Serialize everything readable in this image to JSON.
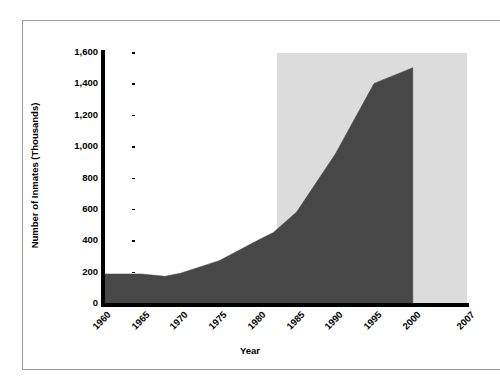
{
  "chart_data": {
    "type": "area",
    "title": "",
    "xlabel": "Year",
    "ylabel": "Number of Inmates (Thousands)",
    "xlim": [
      1960,
      2007
    ],
    "ylim": [
      0,
      1600
    ],
    "grid": false,
    "legend": null,
    "x_tick_labels": [
      "1960",
      "1965",
      "1970",
      "1975",
      "1980",
      "1985",
      "1990",
      "1995",
      "2000",
      "2007"
    ],
    "x_tick_values": [
      1960,
      1965,
      1970,
      1975,
      1980,
      1985,
      1990,
      1995,
      2000,
      2007
    ],
    "y_tick_labels": [
      "0",
      "200",
      "400",
      "600",
      "800",
      "1,000",
      "1,200",
      "1,400",
      "1,600"
    ],
    "y_tick_values": [
      0,
      200,
      400,
      600,
      800,
      1000,
      1200,
      1400,
      1600
    ],
    "x": [
      1960,
      1965,
      1968,
      1970,
      1975,
      1980,
      1982,
      1985,
      1990,
      1995,
      2000
    ],
    "values": [
      185,
      185,
      170,
      190,
      270,
      400,
      450,
      580,
      950,
      1400,
      1500
    ],
    "series_name": "Number of Inmates",
    "series_color": "#474747",
    "highlight_band": {
      "label": "",
      "x_start": 1982.5,
      "x_end": 2007,
      "color": "#dcdcdc"
    },
    "axis_color": "#000000",
    "background_color": "#ffffff"
  },
  "frame": {
    "border_color": "#9a9a9a"
  }
}
